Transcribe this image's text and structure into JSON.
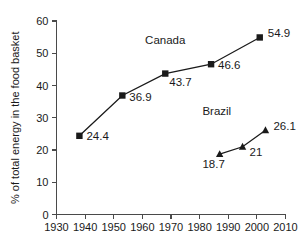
{
  "chart_data": {
    "type": "line",
    "title": "",
    "subtitle": "",
    "xlabel": "",
    "ylabel": "% of total energy in the food basket",
    "xlim": [
      1930,
      2010
    ],
    "ylim": [
      0,
      60
    ],
    "xticks": [
      1930,
      1940,
      1950,
      1960,
      1970,
      1980,
      1990,
      2000,
      2010
    ],
    "yticks": [
      0,
      10,
      20,
      30,
      40,
      50,
      60
    ],
    "grid": false,
    "legend_position": "inline-annotation",
    "series": [
      {
        "name": "Canada",
        "marker": "square",
        "label_x": 1968,
        "label_y": 53,
        "points": [
          {
            "x": 1938,
            "y": 24.4,
            "label": "24.4"
          },
          {
            "x": 1953,
            "y": 36.9,
            "label": "36.9"
          },
          {
            "x": 1968,
            "y": 43.7,
            "label": "43.7"
          },
          {
            "x": 1984,
            "y": 46.6,
            "label": "46.6"
          },
          {
            "x": 2001,
            "y": 54.9,
            "label": "54.9"
          }
        ]
      },
      {
        "name": "Brazil",
        "marker": "triangle",
        "label_x": 1986,
        "label_y": 30.8,
        "points": [
          {
            "x": 1987,
            "y": 18.7,
            "label": "18.7"
          },
          {
            "x": 1995,
            "y": 21,
            "label": "21"
          },
          {
            "x": 2003,
            "y": 26.1,
            "label": "26.1"
          }
        ]
      }
    ]
  },
  "colors": {
    "background": "#ffffff",
    "axis": "#4a4a4a",
    "ink": "#1a1a1a"
  }
}
